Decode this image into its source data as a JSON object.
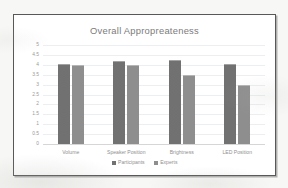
{
  "chart_data": {
    "type": "bar",
    "title": "Overall Appropreateness",
    "xlabel": "",
    "ylabel": "",
    "ylim": [
      0,
      5
    ],
    "ytick_step": 0.5,
    "yticks": [
      "5",
      "4.5",
      "4",
      "3.5",
      "3",
      "2.5",
      "2",
      "1.5",
      "1",
      "0.5",
      "0"
    ],
    "ytick_values": [
      5,
      4.5,
      4,
      3.5,
      3,
      2.5,
      2,
      1.5,
      1,
      0.5,
      0
    ],
    "categories": [
      "Volume",
      "Speaker Position",
      "Brightness",
      "LED Position"
    ],
    "series": [
      {
        "name": "Participants",
        "color": "#717171",
        "values": [
          4.05,
          4.2,
          4.25,
          4.05
        ]
      },
      {
        "name": "Experts",
        "color": "#8e8e8e",
        "values": [
          4.0,
          4.0,
          3.5,
          3.0
        ]
      }
    ],
    "grid": true,
    "grid_orientation": "horizontal",
    "legend_position": "bottom"
  },
  "colors": {
    "participants": "#717171",
    "experts": "#8e8e8e",
    "title_text": "#7b7b7b",
    "axis_text": "#939396",
    "gridline": "#eceff1",
    "frame_border": "#585858",
    "plot_background": "#ffffff",
    "page_background": "#f7f7f5"
  },
  "legend": {
    "items": [
      {
        "label": "Participants",
        "marker": "square-marker-dark"
      },
      {
        "label": "Experts",
        "marker": "square-marker-light"
      }
    ]
  }
}
